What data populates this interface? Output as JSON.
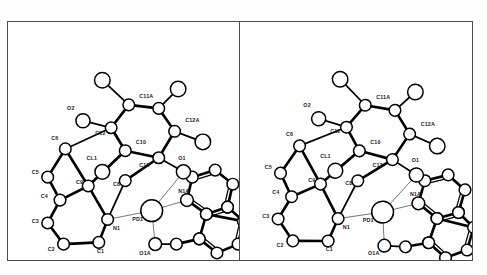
{
  "figure": {
    "kind": "stereo-pair-crystal-structure",
    "panel_count": 2,
    "rendering_style": "ORTEP ball-and-stick line drawing",
    "background_color": "#ffffff",
    "frame_color": "#4d4d4d",
    "bond_color": "#000000",
    "atom_fill_color": "#ffffff",
    "atom_outline_color": "#000000",
    "thin_bond_color": "#555555",
    "panels": [
      {
        "name": "left-view",
        "label": ""
      },
      {
        "name": "right-view",
        "label": ""
      }
    ]
  },
  "structure": {
    "central_atom": "PD1",
    "atom_labels": [
      "C11A",
      "O2",
      "C12",
      "C12A",
      "C10",
      "C6",
      "CL1",
      "C13",
      "O1",
      "C5",
      "C9",
      "C8",
      "CL2",
      "N1A",
      "C4",
      "C3",
      "N1",
      "PD1",
      "C2",
      "C1",
      "O1A"
    ],
    "labels": {
      "c11a": "C11A",
      "o2": "O2",
      "c12": "C12",
      "c12a": "C12A",
      "c10": "C10",
      "c6": "C6",
      "cl1": "CL1",
      "c13": "C13",
      "o1": "O1",
      "c5": "C5",
      "c9": "C9",
      "c8": "C8",
      "cl2": "CL2",
      "n1a": "N1A",
      "c4": "C4",
      "c3": "C3",
      "n1": "N1",
      "pd1": "PD1",
      "c2": "C2",
      "c1": "C1",
      "o1a": "O1A"
    }
  },
  "geometry": {
    "left": {
      "atoms": [
        {
          "id": "h_a",
          "x": 53,
          "y": 33,
          "r": 4.4,
          "label": null
        },
        {
          "id": "h_b",
          "x": 96,
          "y": 38,
          "r": 4.4,
          "label": null
        },
        {
          "id": "c11a_n",
          "x": 68,
          "y": 47,
          "r": 3.3,
          "label": "C11A",
          "lx": 74,
          "ly": 43
        },
        {
          "id": "c11b",
          "x": 85,
          "y": 49,
          "r": 3.3,
          "label": null
        },
        {
          "id": "o2_a",
          "x": 42,
          "y": 56,
          "r": 4.0,
          "label": "O2",
          "lx": 33,
          "ly": 50
        },
        {
          "id": "c12_n",
          "x": 58,
          "y": 60,
          "r": 3.3,
          "label": "C12",
          "lx": 49,
          "ly": 64
        },
        {
          "id": "c12a_n",
          "x": 94,
          "y": 62,
          "r": 3.3,
          "label": "C12A",
          "lx": 100,
          "ly": 57
        },
        {
          "id": "h_c",
          "x": 110,
          "y": 68,
          "r": 4.4,
          "label": null
        },
        {
          "id": "c10_n",
          "x": 66,
          "y": 73,
          "r": 3.3,
          "label": "C10",
          "lx": 72,
          "ly": 69
        },
        {
          "id": "c6_n",
          "x": 32,
          "y": 72,
          "r": 3.3,
          "label": "C6",
          "lx": 24,
          "ly": 67
        },
        {
          "id": "cl1_a",
          "x": 53,
          "y": 85,
          "r": 4.2,
          "label": "CL1",
          "lx": 44,
          "ly": 78
        },
        {
          "id": "c13_n",
          "x": 85,
          "y": 77,
          "r": 3.3,
          "label": "C13",
          "lx": 74,
          "ly": 82
        },
        {
          "id": "o1_a",
          "x": 99,
          "y": 85,
          "r": 4.0,
          "label": "O1",
          "lx": 96,
          "ly": 78
        },
        {
          "id": "c5_n",
          "x": 22,
          "y": 88,
          "r": 3.3,
          "label": "C5",
          "lx": 13,
          "ly": 86
        },
        {
          "id": "c9_n",
          "x": 45,
          "y": 93,
          "r": 3.3,
          "label": "C9",
          "lx": 38,
          "ly": 92
        },
        {
          "id": "c8_n",
          "x": 66,
          "y": 90,
          "r": 3.3,
          "label": "C8",
          "lx": 59,
          "ly": 93
        },
        {
          "id": "c4_n",
          "x": 29,
          "y": 101,
          "r": 3.3,
          "label": "C4",
          "lx": 18,
          "ly": 100
        },
        {
          "id": "pd1_n",
          "x": 81,
          "y": 107,
          "r": 6.2,
          "label": "PD1",
          "lx": 70,
          "ly": 113
        },
        {
          "id": "c3_n",
          "x": 22,
          "y": 114,
          "r": 3.3,
          "label": "C3",
          "lx": 13,
          "ly": 114
        },
        {
          "id": "n1_n",
          "x": 56,
          "y": 112,
          "r": 3.3,
          "label": "N1",
          "lx": 59,
          "ly": 118
        },
        {
          "id": "c2_n",
          "x": 31,
          "y": 126,
          "r": 3.3,
          "label": "C2",
          "lx": 22,
          "ly": 130
        },
        {
          "id": "c1_n",
          "x": 51,
          "y": 125,
          "r": 3.3,
          "label": "C1",
          "lx": 50,
          "ly": 131
        },
        {
          "id": "o1a_n",
          "x": 83,
          "y": 126,
          "r": 3.6,
          "label": "O1A",
          "lx": 74,
          "ly": 132
        },
        {
          "id": "n1a_n",
          "x": 101,
          "y": 101,
          "r": 3.6,
          "label": "N1A",
          "lx": 96,
          "ly": 97
        }
      ]
    }
  }
}
